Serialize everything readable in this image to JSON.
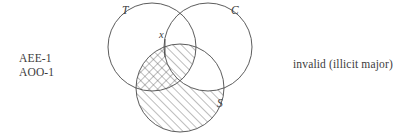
{
  "figure": {
    "kind": "three-circle-venn-diagram",
    "stroke_color": "#4a4a4a",
    "hatch_color": "#5a5a5a",
    "background_color": "#ffffff",
    "text_color": "#3c3c3c"
  },
  "left_labels": {
    "line1": "AEE-1",
    "line2": "AOO-1"
  },
  "right_label": {
    "text": "invalid (illicit major)"
  },
  "venn": {
    "circles": [
      {
        "id": "T",
        "label": "T",
        "cx": 152,
        "cy": 47,
        "r": 44,
        "label_x": 123,
        "label_y": 13
      },
      {
        "id": "C",
        "label": "C",
        "cx": 208,
        "cy": 47,
        "r": 44,
        "label_x": 232,
        "label_y": 13
      },
      {
        "id": "S",
        "label": "S",
        "cx": 180,
        "cy": 88,
        "r": 44,
        "label_x": 219,
        "label_y": 106
      }
    ],
    "individual_mark": {
      "label": "x",
      "label_x": 161,
      "label_y": 37,
      "bar_x": 165,
      "bar_y1": 39,
      "bar_y2": 57
    },
    "shaded_regions": [
      {
        "region": "S-minus-C",
        "style": "hatch-forward"
      },
      {
        "region": "S-and-T-minus-C",
        "style": "crosshatch"
      },
      {
        "region": "S-and-T-and-C",
        "style": "hatch-forward"
      },
      {
        "region": "S-and-C-minus-T",
        "style": "none"
      }
    ]
  }
}
